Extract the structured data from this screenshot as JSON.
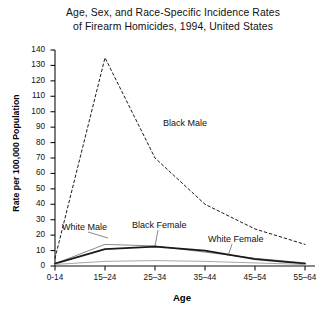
{
  "chart_data": {
    "type": "line",
    "title": "Age, Sex, and Race-Specific Incidence Rates of Firearm Homicides, 1994, United States",
    "title_line1": "Age, Sex, and Race-Specific Incidence Rates",
    "title_line2": "of Firearm Homicides, 1994, United States",
    "xlabel": "Age",
    "ylabel": "Rate per 100,000 Population",
    "categories": [
      "0-14",
      "15–24",
      "25–34",
      "35–44",
      "45–54",
      "55–64"
    ],
    "ylim": [
      0,
      140
    ],
    "ytick_step": 10,
    "yticks": [
      0,
      10,
      20,
      30,
      40,
      50,
      60,
      70,
      80,
      90,
      100,
      110,
      120,
      130,
      140
    ],
    "grid": false,
    "legend_position": "inline-annotations",
    "series": [
      {
        "name": "Black Male",
        "style": "dashed",
        "color": "#1a1a1a",
        "width": 1.0,
        "values": [
          5,
          135,
          70,
          40,
          24,
          14
        ]
      },
      {
        "name": "White Male",
        "style": "solid",
        "color": "#8a8a8a",
        "width": 1.0,
        "values": [
          1.5,
          14,
          13,
          9,
          5,
          2
        ]
      },
      {
        "name": "Black Female",
        "style": "solid",
        "color": "#1a1a1a",
        "width": 1.8,
        "values": [
          1.5,
          11,
          12.5,
          10,
          4.5,
          1.5
        ]
      },
      {
        "name": "White Female",
        "style": "solid",
        "color": "#9c9c9c",
        "width": 0.9,
        "values": [
          1,
          3,
          3.5,
          3,
          2,
          1
        ]
      }
    ],
    "annotations": [
      {
        "text": "Black Male",
        "x": 163,
        "y": 118
      },
      {
        "text": "White Male",
        "x": 62,
        "y": 222
      },
      {
        "text": "Black Female",
        "x": 132,
        "y": 220
      },
      {
        "text": "White Female",
        "x": 208,
        "y": 234
      }
    ]
  }
}
